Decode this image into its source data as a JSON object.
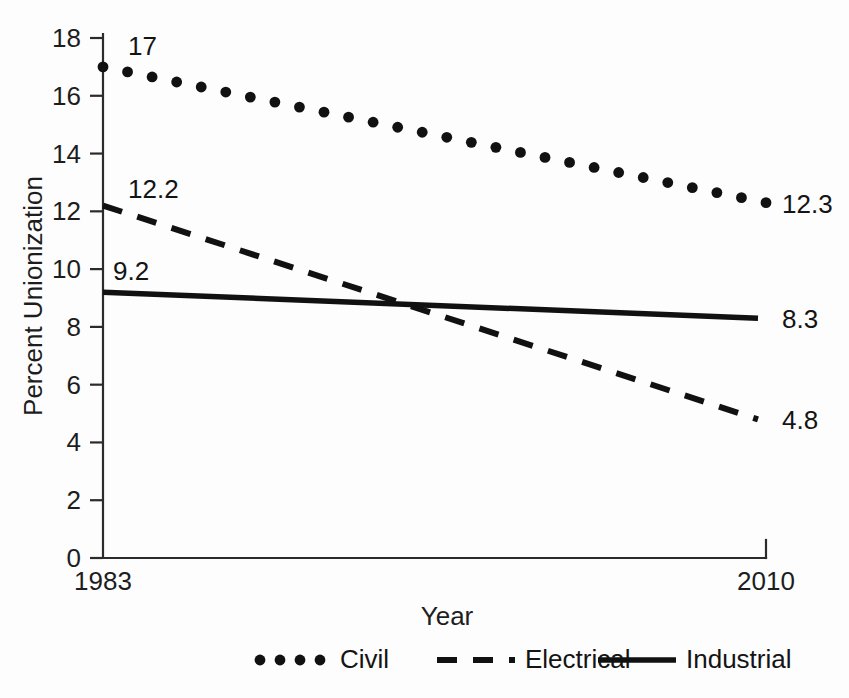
{
  "chart_data": {
    "type": "line",
    "title": "",
    "xlabel": "Year",
    "ylabel": "Percent Unionization",
    "xlim": [
      1983,
      2010
    ],
    "ylim": [
      0,
      18
    ],
    "ytick_step": 2,
    "yticks": [
      "0",
      "2",
      "4",
      "6",
      "8",
      "10",
      "12",
      "14",
      "16",
      "18"
    ],
    "xticks": [
      "1983",
      "2010"
    ],
    "grid": false,
    "legend_position": "bottom",
    "x": [
      1983,
      2010
    ],
    "series": [
      {
        "name": "Civil",
        "style": "dotted",
        "start_value": 17.0,
        "end_value": 12.3,
        "start_label": "17",
        "end_label": "12.3",
        "values": [
          17.0,
          12.3
        ],
        "n_markers": 28
      },
      {
        "name": "Electrical",
        "style": "dashed",
        "start_value": 12.2,
        "end_value": 4.8,
        "start_label": "12.2",
        "end_label": "4.8",
        "values": [
          12.2,
          4.8
        ]
      },
      {
        "name": "Industrial",
        "style": "solid",
        "start_value": 9.2,
        "end_value": 8.3,
        "start_label": "9.2",
        "end_label": "8.3",
        "values": [
          9.2,
          8.3
        ]
      }
    ],
    "annotations": [
      {
        "text": "17",
        "series": "Civil",
        "position": "start"
      },
      {
        "text": "12.3",
        "series": "Civil",
        "position": "end"
      },
      {
        "text": "12.2",
        "series": "Electrical",
        "position": "start"
      },
      {
        "text": "4.8",
        "series": "Electrical",
        "position": "end"
      },
      {
        "text": "9.2",
        "series": "Industrial",
        "position": "start"
      },
      {
        "text": "8.3",
        "series": "Industrial",
        "position": "end"
      }
    ],
    "colors": {
      "ink": "#111111",
      "axis": "#2b2b2b",
      "background": "#fdfdfd"
    }
  },
  "legend": {
    "items": [
      {
        "label": "Civil",
        "style": "dotted"
      },
      {
        "label": "Electrical",
        "style": "dashed"
      },
      {
        "label": "Industrial",
        "style": "solid"
      }
    ]
  },
  "axes": {
    "y_title": "Percent Unionization",
    "x_title": "Year",
    "y_tick_labels": [
      "18",
      "16",
      "14",
      "12",
      "10",
      "8",
      "6",
      "4",
      "2",
      "0"
    ],
    "x_tick_labels": [
      "1983",
      "2010"
    ]
  },
  "start_labels": {
    "civil": "17",
    "electrical": "12.2",
    "industrial": "9.2"
  },
  "end_labels": {
    "civil": "12.3",
    "electrical": "8.3",
    "industrial": "4.8"
  }
}
